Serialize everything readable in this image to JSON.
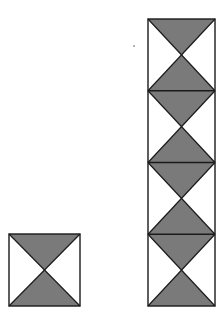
{
  "diagram": {
    "colors": {
      "fill": "#7a7a7a",
      "stroke": "#1a1a1a",
      "background": "#ffffff"
    },
    "single_tile": {
      "x": 8,
      "y": 233,
      "width": 71,
      "height": 72,
      "tiles": 1
    },
    "stacked_column": {
      "x": 147,
      "y": 18,
      "width": 67,
      "height": 287,
      "tiles": 4
    },
    "artifact_speck": {
      "x": 133,
      "y": 45
    }
  }
}
